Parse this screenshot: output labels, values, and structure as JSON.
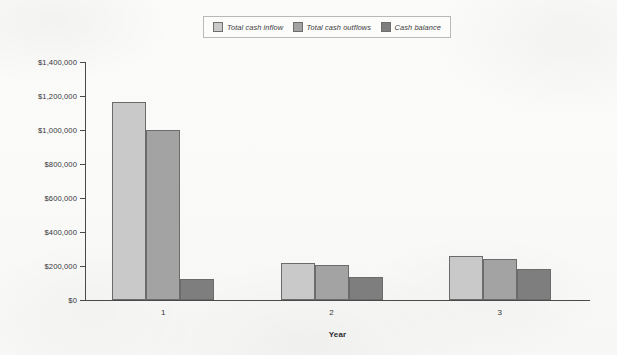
{
  "chart_data": {
    "type": "bar",
    "title": "",
    "subtitle": "",
    "xlabel": "Year",
    "ylabel": "",
    "categories": [
      "1",
      "2",
      "3"
    ],
    "series": [
      {
        "name": "Total cash inflow",
        "color": "#c9c9c9",
        "values": [
          1165000,
          220000,
          260000
        ]
      },
      {
        "name": "Total cash outflows",
        "color": "#a3a3a3",
        "values": [
          1000000,
          207000,
          242000
        ]
      },
      {
        "name": "Cash balance",
        "color": "#7e7e7e",
        "values": [
          125000,
          138000,
          185000
        ]
      }
    ],
    "ylim": [
      0,
      1400000
    ],
    "ytick_step": 200000,
    "ytick_labels": [
      "$0",
      "$200,000",
      "$400,000",
      "$600,000",
      "$800,000",
      "$1,000,000",
      "$1,200,000",
      "$1,400,000"
    ],
    "ytick_values": [
      0,
      200000,
      400000,
      600000,
      800000,
      1000000,
      1200000,
      1400000
    ],
    "grid": false,
    "legend_position": "top-center",
    "bar_border_color": "#6b6b6b",
    "axis_color": "#4a4a4a",
    "background_color": "#fbfbf9"
  }
}
